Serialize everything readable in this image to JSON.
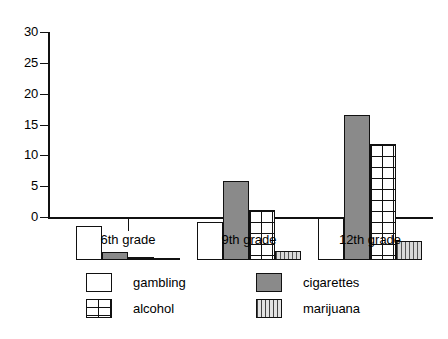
{
  "chart_data": {
    "type": "bar",
    "title": "",
    "xlabel": "",
    "ylabel": "",
    "categories": [
      "6th grade",
      "9th grade",
      "12th grade"
    ],
    "series": [
      {
        "name": "gambling",
        "pattern": "empty",
        "values": [
          5.5,
          6.2,
          6.8
        ]
      },
      {
        "name": "cigarettes",
        "pattern": "solid-gray",
        "values": [
          1.3,
          12.8,
          23.5
        ]
      },
      {
        "name": "alcohol",
        "pattern": "grid-crosshatch",
        "values": [
          0.5,
          8.1,
          18.8
        ]
      },
      {
        "name": "marijuana",
        "pattern": "vertical-stripes",
        "values": [
          0.15,
          1.4,
          3.1
        ]
      }
    ],
    "ylim": [
      0,
      30
    ],
    "yticks": [
      0,
      5,
      10,
      15,
      20,
      25,
      30
    ],
    "ytick_labels": [
      "0",
      "5",
      "10",
      "15",
      "20",
      "25",
      "30"
    ],
    "grid": false,
    "legend_position": "bottom"
  },
  "legend": {
    "items": [
      {
        "label": "gambling"
      },
      {
        "label": "cigarettes"
      },
      {
        "label": "alcohol"
      },
      {
        "label": "marijuana"
      }
    ]
  },
  "colors": {
    "axis": "#111111",
    "gambling": "#ffffff",
    "cigarettes": "#8a8a8a",
    "alcohol": "#ffffff",
    "marijuana": "#d9d9d9",
    "background": "#ffffff"
  }
}
